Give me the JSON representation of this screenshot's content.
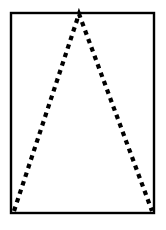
{
  "figure": {
    "title": "Dashed triangle inscribed in a solid rectangle",
    "description": "An isosceles-like triangle drawn with a thick dashed black line, its apex touching the top edge of a solid-bordered rectangle and its base corners coinciding with the rectangle's bottom-left and bottom-right corners.",
    "canvas": {
      "width": 166,
      "height": 230,
      "background_color": "#ffffff"
    },
    "rectangle": {
      "name": "outer-rectangle",
      "x": 11,
      "y": 13,
      "width": 143,
      "height": 200,
      "stroke_color": "#000000",
      "stroke_width": 2.4,
      "fill_color": "#ffffff",
      "line_style": "solid"
    },
    "triangle": {
      "name": "dashed-triangle",
      "apex": {
        "x": 79,
        "y": 14
      },
      "bottom_left": {
        "x": 14,
        "y": 211
      },
      "bottom_right": {
        "x": 152,
        "y": 211
      },
      "stroke_color": "#000000",
      "stroke_width": 4.2,
      "fill_color": "none",
      "line_style": "dashed",
      "dash_length": 4.5,
      "dash_gap": 4.5,
      "base_drawn": false
    },
    "labels": {
      "apex_label": "",
      "left_vertex_label": "",
      "right_vertex_label": "",
      "caption": ""
    }
  }
}
